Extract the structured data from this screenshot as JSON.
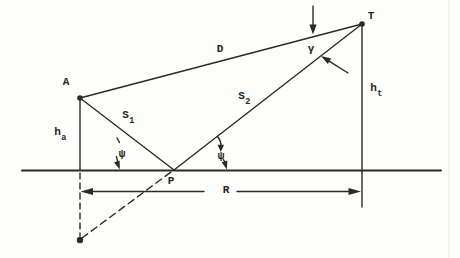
{
  "figure": {
    "type": "multipath-propagation-geometry-diagram",
    "ink_color": "#2a2a28",
    "paper_color": "#fdfdfb",
    "points": {
      "antenna": "A",
      "target": "T",
      "reflection_point": "P"
    },
    "labels": {
      "direct_path": "D",
      "gamma_angle": "γ",
      "s1": {
        "base": "S",
        "sub": "1"
      },
      "s2": {
        "base": "S",
        "sub": "2"
      },
      "antenna_height": {
        "base": "h",
        "sub": "a"
      },
      "target_height": {
        "base": "h",
        "sub": "t"
      },
      "psi_left": "ψ",
      "psi_right": "ψ",
      "range": "R"
    }
  }
}
